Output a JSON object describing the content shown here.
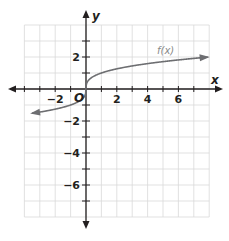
{
  "chart_data": {
    "type": "line",
    "title": "",
    "xlabel": "x",
    "ylabel": "y",
    "origin_label": "O",
    "xlim": [
      -4,
      8
    ],
    "ylim": [
      -8,
      4
    ],
    "grid": true,
    "grid_step": 1,
    "x_ticks": [
      -2,
      2,
      4,
      6
    ],
    "x_tick_labels": [
      "−2",
      "2",
      "4",
      "6"
    ],
    "y_ticks": [
      2,
      -2,
      -4,
      -6
    ],
    "y_tick_labels": [
      "2",
      "−2",
      "−4",
      "−6"
    ],
    "series": [
      {
        "name": "f(x)",
        "function": "cube root of x",
        "domain_shown": [
          -3.5,
          7.9
        ],
        "arrows_both_ends": true,
        "color": "#6d6e71",
        "x": [
          -3.5,
          -2,
          -1,
          -0.5,
          -0.1,
          0,
          0.1,
          0.5,
          1,
          2,
          4,
          6,
          7.9
        ],
        "y": [
          -1.52,
          -1.26,
          -1.0,
          -0.79,
          -0.46,
          0,
          0.46,
          0.79,
          1.0,
          1.26,
          1.59,
          1.82,
          1.99
        ]
      }
    ],
    "legend": "none; curve labeled 'f(x)' near (5, 2.4)",
    "colors": {
      "grid": "#d9d9d9",
      "axes": "#231f20",
      "curve": "#6d6e71",
      "background": "#ffffff"
    }
  }
}
